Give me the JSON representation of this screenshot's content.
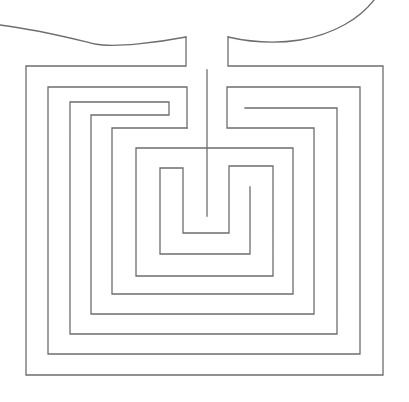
{
  "diagram": {
    "type": "labyrinth",
    "stroke_color": "#6e6e6e",
    "background": "#ffffff",
    "width": 409,
    "height": 402,
    "curves": [
      {
        "name": "top-left-curve",
        "d": "M0,25 C40,30 70,38 95,44 C115,48 160,42 186,37"
      },
      {
        "name": "top-right-curve",
        "d": "M228,37 C250,42 275,44 300,40 C335,34 360,18 374,0"
      }
    ],
    "walls": [
      {
        "name": "entrance-left-wall",
        "d": "M186,37 L186,66 L26,66 L26,375 L383,375 L383,66 L228,66 L228,37"
      },
      {
        "name": "center-spine",
        "d": "M207,70 L207,216"
      },
      {
        "name": "ring-2",
        "d": "M187,128 L187,87 L48,87 L48,354 L360,354 L360,87 L227,87 L227,128 L314,128 L314,314 L91,314 L91,115 L169,115 L169,102 L70,102 L70,334 L337,334 L337,108 L245,108"
      },
      {
        "name": "ring-3",
        "d": "M187,128 L112,128 L112,294 L293,294 L293,148 L136,148 L136,276 L273,276 L273,166 L229,166 L229,233 L183,233 L183,168 L160,168 L160,254 L250,254 L250,187"
      }
    ]
  }
}
